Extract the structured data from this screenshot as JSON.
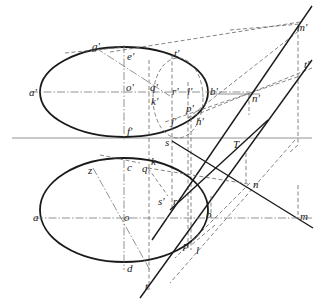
{
  "diagram": {
    "type": "descriptive-geometry",
    "upper_view_labels": {
      "g": "g'",
      "e": "e'",
      "a": "a'",
      "o": "o'",
      "q": "q'",
      "k": "k'",
      "r": "r'",
      "t1": "t'",
      "l": "l'",
      "p": "p'",
      "j": "j'",
      "h": "h'",
      "b": "b'",
      "f": "f'",
      "n": "n'",
      "m": "m'",
      "tp": "t'"
    },
    "ground_labels": {
      "s": "s",
      "T": "T"
    },
    "lower_view_labels": {
      "z": "z",
      "c": "c",
      "k": "k",
      "q": "q",
      "a": "a",
      "o": "o",
      "s": "s'",
      "r": "r",
      "b": "b",
      "p": "p",
      "l": "l",
      "d": "d",
      "t": "t",
      "n": "n",
      "m": "m"
    }
  }
}
